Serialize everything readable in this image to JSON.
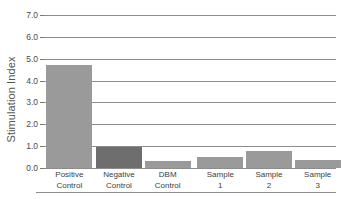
{
  "chart_data": {
    "type": "bar",
    "title": "",
    "xlabel": "",
    "ylabel": "Stimulation Index",
    "ylim": [
      0.0,
      7.0
    ],
    "ytick_step": 1.0,
    "yticks": [
      "0.0",
      "1.0",
      "2.0",
      "3.0",
      "4.0",
      "5.0",
      "6.0",
      "7.0"
    ],
    "ytick_values": [
      0.0,
      1.0,
      2.0,
      3.0,
      4.0,
      5.0,
      6.0,
      7.0
    ],
    "grid": true,
    "legend": "none",
    "categories": [
      "Positive Control",
      "Negative Control",
      "DBM Control",
      "Sample 1",
      "Sample 2",
      "Sample 3"
    ],
    "category_lines": [
      [
        "Positive",
        "Control"
      ],
      [
        "Negative",
        "Control"
      ],
      [
        "DBM",
        "Control"
      ],
      [
        "Sample",
        "1"
      ],
      [
        "Sample",
        "2"
      ],
      [
        "Sample",
        "3"
      ]
    ],
    "values": [
      4.7,
      0.95,
      0.3,
      0.5,
      0.78,
      0.35
    ],
    "bar_colors": [
      "#9a9a9a",
      "#6e6e6e",
      "#9a9a9a",
      "#9a9a9a",
      "#9a9a9a",
      "#9a9a9a"
    ]
  },
  "colors": {
    "gridline": "#8d8d8d",
    "axis_text": "#4a4a4a",
    "background": "#ffffff",
    "bar_light": "#9a9a9a",
    "bar_dark": "#6e6e6e"
  }
}
